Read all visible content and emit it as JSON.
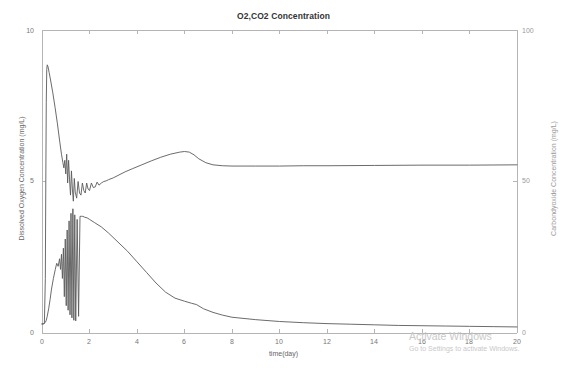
{
  "chart_data": {
    "type": "line",
    "title": "O2,CO2 Concentration",
    "xlabel": "time(day)",
    "ylabel": "Dissolved Oxygen Concentration (mg/L)",
    "y2label": "Carbondyoxide Concentration (mg/L)",
    "xlim": [
      0,
      20
    ],
    "ylim": [
      0,
      10
    ],
    "y2lim": [
      0,
      100
    ],
    "xticks": [
      "0",
      "2",
      "4",
      "6",
      "8",
      "10",
      "12",
      "14",
      "16",
      "18",
      "20"
    ],
    "yticks_left": [
      "0",
      "5",
      "10"
    ],
    "yticks_right": [
      "0",
      "50",
      "100"
    ],
    "grid": false,
    "legend": "none",
    "line_color": "#5a5a5a",
    "axis_color": "#b5b5b5",
    "series": [
      {
        "name": "Dissolved Oxygen Concentration",
        "axis": "left",
        "units": "mg/L",
        "x": [
          0.0,
          0.05,
          0.1,
          0.14,
          0.16,
          0.18,
          0.2,
          0.22,
          0.25,
          0.3,
          0.36,
          0.45,
          0.55,
          0.65,
          0.75,
          0.82,
          0.88,
          0.92,
          0.96,
          1.0,
          1.04,
          1.08,
          1.12,
          1.16,
          1.2,
          1.24,
          1.28,
          1.32,
          1.36,
          1.4,
          1.46,
          1.52,
          1.58,
          1.64,
          1.7,
          1.76,
          1.82,
          1.88,
          1.94,
          2.0,
          2.08,
          2.16,
          2.24,
          2.32,
          2.4,
          2.5,
          2.6,
          2.7,
          2.8,
          3.0,
          3.2,
          3.5,
          3.8,
          4.2,
          4.6,
          5.0,
          5.4,
          5.8,
          6.0,
          6.2,
          6.4,
          6.6,
          6.9,
          7.2,
          7.6,
          8.0,
          8.5,
          9.0,
          10.0,
          11.0,
          12.0,
          14.0,
          16.0,
          18.0,
          20.0
        ],
        "y": [
          0.3,
          0.3,
          0.32,
          1.8,
          5.0,
          7.6,
          8.7,
          8.85,
          8.8,
          8.6,
          8.35,
          7.95,
          7.45,
          6.9,
          6.3,
          5.9,
          5.62,
          5.45,
          5.7,
          5.25,
          5.9,
          4.95,
          5.7,
          5.05,
          4.55,
          5.35,
          4.75,
          4.35,
          5.1,
          4.65,
          4.45,
          5.0,
          4.62,
          4.55,
          4.95,
          4.7,
          4.62,
          4.95,
          4.75,
          4.7,
          4.95,
          4.8,
          4.82,
          4.98,
          4.88,
          4.95,
          5.0,
          5.02,
          5.06,
          5.12,
          5.2,
          5.32,
          5.42,
          5.55,
          5.68,
          5.8,
          5.9,
          5.97,
          5.99,
          5.97,
          5.88,
          5.75,
          5.62,
          5.55,
          5.52,
          5.51,
          5.51,
          5.51,
          5.51,
          5.52,
          5.52,
          5.53,
          5.54,
          5.54,
          5.55
        ]
      },
      {
        "name": "Carbondyoxide Concentration",
        "axis": "right",
        "units": "mg/L",
        "x": [
          0.0,
          0.05,
          0.1,
          0.14,
          0.18,
          0.22,
          0.28,
          0.34,
          0.4,
          0.48,
          0.56,
          0.62,
          0.68,
          0.74,
          0.78,
          0.82,
          0.86,
          0.9,
          0.94,
          0.98,
          1.02,
          1.06,
          1.1,
          1.14,
          1.18,
          1.22,
          1.26,
          1.3,
          1.34,
          1.38,
          1.42,
          1.48,
          1.54,
          1.6,
          1.66,
          1.72,
          1.8,
          1.9,
          2.0,
          2.2,
          2.5,
          2.8,
          3.2,
          3.6,
          4.0,
          4.4,
          4.8,
          5.2,
          5.6,
          6.0,
          6.3,
          6.5,
          6.8,
          7.2,
          7.6,
          8.0,
          9.0,
          10.0,
          11.0,
          12.0,
          13.0,
          14.0,
          15.0,
          16.0,
          17.0,
          18.0,
          19.0,
          20.0
        ],
        "y": [
          3.0,
          3.0,
          3.2,
          3.5,
          4.2,
          5.5,
          8.0,
          11.0,
          14.5,
          18.0,
          21.0,
          23.0,
          22.0,
          24.5,
          21.0,
          26.0,
          18.0,
          28.0,
          12.0,
          31.0,
          9.0,
          34.0,
          7.5,
          37.0,
          6.0,
          39.5,
          5.0,
          41.0,
          4.2,
          39.0,
          4.0,
          37.5,
          5.5,
          38.5,
          38.5,
          38.5,
          38.2,
          38.0,
          37.5,
          36.5,
          35.0,
          33.0,
          30.0,
          27.0,
          23.5,
          20.0,
          16.5,
          13.5,
          11.5,
          10.5,
          9.8,
          9.4,
          8.0,
          6.8,
          5.9,
          5.2,
          4.4,
          3.8,
          3.4,
          3.1,
          2.9,
          2.7,
          2.5,
          2.4,
          2.3,
          2.2,
          2.1,
          2.0
        ]
      }
    ]
  },
  "watermark": {
    "title": "Activate Windows",
    "subtitle": "Go to Settings to activate Windows."
  }
}
